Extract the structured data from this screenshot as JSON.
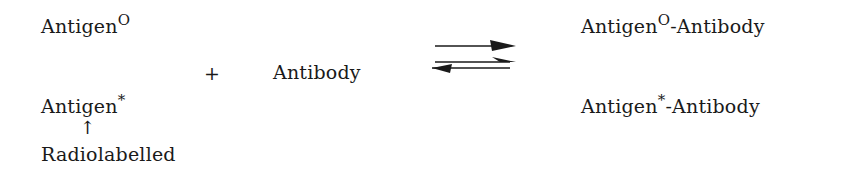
{
  "reactants": {
    "unlabelled_antigen": {
      "base": "Antigen",
      "superscript": "O"
    },
    "labelled_antigen": {
      "base": "Antigen",
      "superscript": "*"
    },
    "plus": "+",
    "antibody": "Antibody",
    "annotation_arrow": "↑",
    "annotation_label": "Radiolabelled"
  },
  "reaction_arrow": {
    "type": "reversible-equilibrium",
    "icon": "equilibrium-arrows-icon"
  },
  "products": {
    "unlabelled_complex": {
      "base": "Antigen",
      "superscript": "O",
      "suffix": "-Antibody"
    },
    "labelled_complex": {
      "base": "Antigen",
      "superscript": "*",
      "suffix": "-Antibody"
    }
  }
}
